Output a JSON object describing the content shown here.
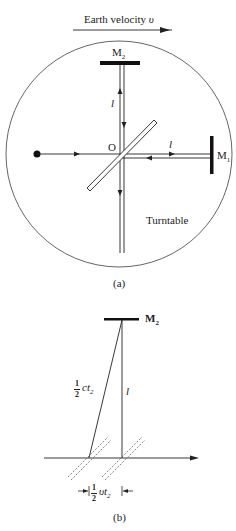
{
  "figure_a": {
    "velocity_label": "Earth velocity ",
    "velocity_symbol": "υ",
    "mirror2_label": "M",
    "mirror2_sub": "2",
    "mirror1_label": "M",
    "mirror1_sub": "1",
    "origin_label": "O",
    "arm_length_vertical": "l",
    "arm_length_horizontal": "l",
    "turntable_label": "Turntable",
    "caption": "(a)"
  },
  "figure_b": {
    "mirror2_label": "M",
    "mirror2_sub": "2",
    "hyp_num": "1",
    "hyp_den": "2",
    "hyp_expr": "ct",
    "hyp_sub": "2",
    "arm_length": "l",
    "shift_num": "1",
    "shift_den": "2",
    "shift_expr": "υt",
    "shift_sub": "2",
    "caption": "(b)"
  },
  "colors": {
    "line": "#222222",
    "circle": "#555555",
    "dashed": "#666666"
  }
}
